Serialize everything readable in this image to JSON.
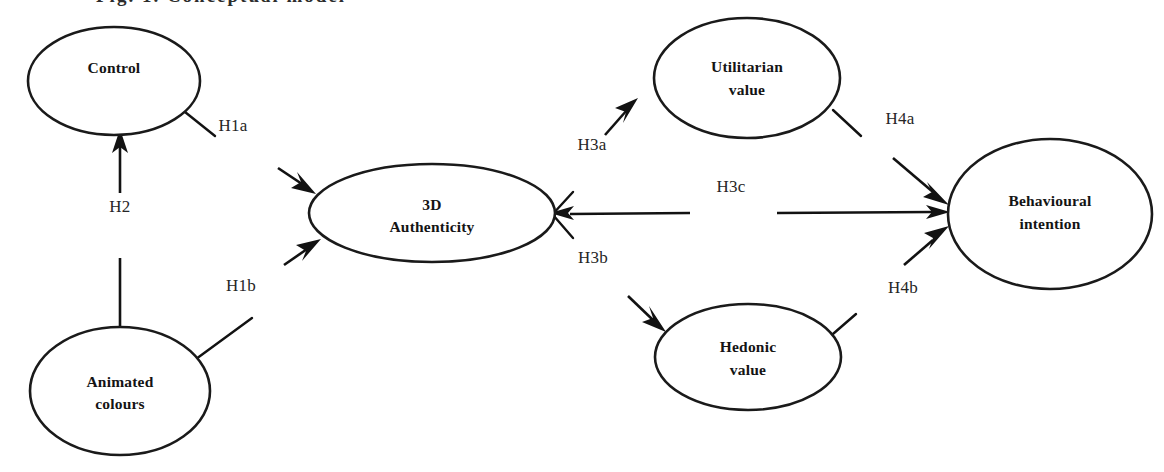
{
  "figure": {
    "title_fragment": "Fig. 1. Conceptual model",
    "width": 1164,
    "height": 472,
    "background_color": "#ffffff",
    "stroke_color": "#121212",
    "text_color": "#141414"
  },
  "nodes": [
    {
      "id": "control",
      "label_line1": "Control",
      "label_line2": "",
      "cx": 114,
      "cy": 81,
      "rx": 86,
      "ry": 54
    },
    {
      "id": "animated-colours",
      "label_line1": "Animated",
      "label_line2": "colours",
      "cx": 120,
      "cy": 391,
      "rx": 90,
      "ry": 64
    },
    {
      "id": "3d-authenticity",
      "label_line1": "3D",
      "label_line2": "Authenticity",
      "cx": 432,
      "cy": 213,
      "rx": 123,
      "ry": 49
    },
    {
      "id": "utilitarian-value",
      "label_line1": "Utilitarian",
      "label_line2": "value",
      "cx": 747,
      "cy": 78,
      "rx": 93,
      "ry": 60
    },
    {
      "id": "hedonic-value",
      "label_line1": "Hedonic",
      "label_line2": "value",
      "cx": 748,
      "cy": 357,
      "rx": 93,
      "ry": 53
    },
    {
      "id": "behavioural-intention",
      "label_line1": "Behavioural",
      "label_line2": "intention",
      "cx": 1050,
      "cy": 214,
      "rx": 102,
      "ry": 75
    }
  ],
  "hypotheses": [
    {
      "id": "h1a",
      "label": "H1a",
      "x": 233,
      "y": 131
    },
    {
      "id": "h2",
      "label": "H2",
      "x": 120,
      "y": 212
    },
    {
      "id": "h1b",
      "label": "H1b",
      "x": 241,
      "y": 291
    },
    {
      "id": "h3a",
      "label": "H3a",
      "x": 592,
      "y": 150
    },
    {
      "id": "h3b",
      "label": "H3b",
      "x": 593,
      "y": 263
    },
    {
      "id": "h3c",
      "label": "H3c",
      "x": 731,
      "y": 192
    },
    {
      "id": "h4a",
      "label": "H4a",
      "x": 900,
      "y": 124
    },
    {
      "id": "h4b",
      "label": "H4b",
      "x": 903,
      "y": 293
    }
  ]
}
